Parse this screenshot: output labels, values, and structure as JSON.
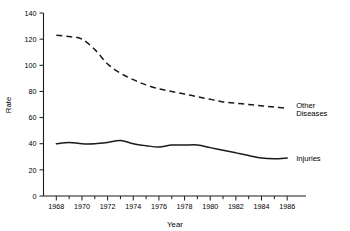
{
  "chart_data": {
    "type": "line",
    "title": "",
    "xlabel": "Year",
    "ylabel": "Rate",
    "xlim": [
      1967,
      1987
    ],
    "ylim": [
      0,
      140
    ],
    "grid": false,
    "legend_position": "right-inline",
    "x": [
      1968,
      1969,
      1970,
      1971,
      1972,
      1973,
      1974,
      1975,
      1976,
      1977,
      1978,
      1979,
      1980,
      1981,
      1982,
      1983,
      1984,
      1985,
      1986
    ],
    "x_tick_labels": [
      "1968",
      "1970",
      "1972",
      "1974",
      "1976",
      "1978",
      "1980",
      "1982",
      "1984",
      "1986"
    ],
    "x_tick_values": [
      1968,
      1970,
      1972,
      1974,
      1976,
      1978,
      1980,
      1982,
      1984,
      1986
    ],
    "x_minor_tick_values": [
      1969,
      1971,
      1973,
      1975,
      1977,
      1979,
      1981,
      1983,
      1985
    ],
    "y_tick_labels": [
      "0",
      "20",
      "40",
      "60",
      "80",
      "100",
      "120",
      "140"
    ],
    "y_tick_values": [
      0,
      20,
      40,
      60,
      80,
      100,
      120,
      140
    ],
    "series": [
      {
        "name": "Other Diseases",
        "label": "Other",
        "label_line2": "Diseases",
        "style": "dashed",
        "color": "#1a1a1a",
        "values": [
          123,
          122,
          120,
          112,
          101,
          94,
          89,
          85,
          82,
          80,
          78,
          76,
          74,
          72,
          71,
          70,
          69,
          68,
          67
        ]
      },
      {
        "name": "Injuries",
        "label": "Injuries",
        "label_line2": "",
        "style": "solid",
        "color": "#1a1a1a",
        "values": [
          40,
          41,
          40,
          40,
          41,
          42.5,
          40,
          38.5,
          37.5,
          39,
          39,
          39,
          37,
          35,
          33,
          31,
          29,
          28.5,
          29
        ]
      }
    ]
  }
}
